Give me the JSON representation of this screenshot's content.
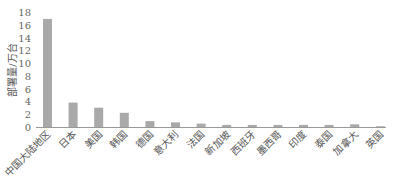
{
  "chart_data": {
    "type": "bar",
    "title": "",
    "xlabel": "",
    "ylabel": "部署量/万台",
    "ylim": [
      0,
      18
    ],
    "yticks": [
      0,
      2,
      4,
      6,
      8,
      10,
      12,
      14,
      16,
      18
    ],
    "grid": false,
    "legend": null,
    "bar_color": "#a9a9a9",
    "categories": [
      "中国大陆地区",
      "日本",
      "美国",
      "韩国",
      "德国",
      "意大利",
      "法国",
      "新加坡",
      "西班牙",
      "墨西哥",
      "印度",
      "泰国",
      "加拿大",
      "英国"
    ],
    "values": [
      17.0,
      3.9,
      3.1,
      2.3,
      1.0,
      0.8,
      0.6,
      0.4,
      0.4,
      0.4,
      0.4,
      0.4,
      0.5,
      0.2
    ]
  }
}
